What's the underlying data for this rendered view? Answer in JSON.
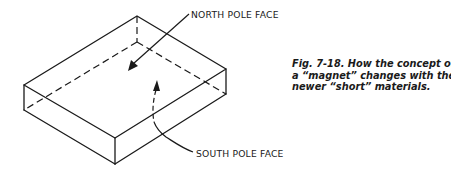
{
  "figure": {
    "labels": {
      "north": "NORTH POLE FACE",
      "south": "SOUTH POLE FACE"
    },
    "caption": {
      "lines": [
        "Fig. 7-18. How the concept of",
        "a “magnet” changes with the",
        "newer “short” materials."
      ]
    },
    "colors": {
      "ink": "#1a1a1a",
      "background": "#ffffff"
    }
  }
}
